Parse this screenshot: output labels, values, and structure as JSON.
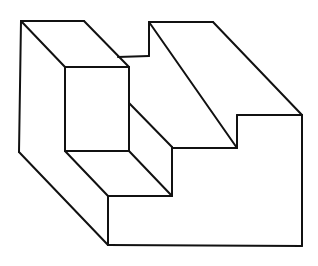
{
  "figure": {
    "stroke_color": "#111111",
    "background": "#ffffff"
  },
  "segments": [
    [
      21,
      21,
      84,
      21
    ],
    [
      84,
      21,
      129,
      67
    ],
    [
      21,
      21,
      65,
      67
    ],
    [
      65,
      67,
      129,
      67
    ],
    [
      65,
      67,
      65,
      151
    ],
    [
      129,
      67,
      129,
      151
    ],
    [
      65,
      151,
      129,
      151
    ],
    [
      21,
      21,
      19,
      152
    ],
    [
      19,
      152,
      108,
      245
    ],
    [
      108,
      245,
      302,
      246
    ],
    [
      302,
      115,
      302,
      246
    ],
    [
      118,
      57,
      149,
      56
    ],
    [
      149,
      22,
      149,
      56
    ],
    [
      149,
      22,
      213,
      22
    ],
    [
      213,
      22,
      302,
      115
    ],
    [
      149,
      22,
      237,
      148
    ],
    [
      237,
      115,
      302,
      115
    ],
    [
      237,
      115,
      237,
      148
    ],
    [
      129,
      103,
      172,
      147
    ],
    [
      172,
      148,
      237,
      148
    ],
    [
      172,
      147,
      172,
      196
    ],
    [
      129,
      151,
      172,
      196
    ],
    [
      65,
      151,
      108,
      196
    ],
    [
      108,
      196,
      172,
      196
    ],
    [
      108,
      196,
      108,
      245
    ]
  ]
}
